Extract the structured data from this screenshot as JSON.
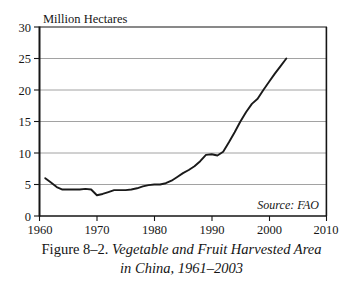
{
  "figure": {
    "caption_figure_number": "Figure 8–2.",
    "caption_title_line1": "Vegetable and Fruit Harvested Area",
    "caption_title_line2": "in China, 1961–2003",
    "source_note": "Source: FAO"
  },
  "chart_data": {
    "type": "line",
    "title": "",
    "subtitle": "",
    "xlabel": "",
    "ylabel": "Million Hectares",
    "xlim": [
      1960,
      2010
    ],
    "ylim": [
      0,
      30
    ],
    "xticks": [
      1960,
      1970,
      1980,
      1990,
      2000,
      2010
    ],
    "yticks": [
      0,
      5,
      10,
      15,
      20,
      25,
      30
    ],
    "xtick_labels": [
      "1960",
      "1970",
      "1980",
      "1990",
      "2000",
      "2010"
    ],
    "ytick_labels": [
      "0",
      "5",
      "10",
      "15",
      "20",
      "25",
      "30"
    ],
    "grid": "horizontal",
    "legend": "none",
    "annotations": [
      "Source: FAO"
    ],
    "series": [
      {
        "name": "Vegetable and Fruit Harvested Area",
        "units": "Million Hectares",
        "color": "#1a1a1a",
        "x": [
          1961,
          1962,
          1963,
          1964,
          1965,
          1966,
          1967,
          1968,
          1969,
          1970,
          1971,
          1972,
          1973,
          1974,
          1975,
          1976,
          1977,
          1978,
          1979,
          1980,
          1981,
          1982,
          1983,
          1984,
          1985,
          1986,
          1987,
          1988,
          1989,
          1990,
          1991,
          1992,
          1993,
          1994,
          1995,
          1996,
          1997,
          1998,
          1999,
          2000,
          2001,
          2002,
          2003
        ],
        "values": [
          6.0,
          5.3,
          4.6,
          4.2,
          4.2,
          4.2,
          4.2,
          4.3,
          4.2,
          3.3,
          3.5,
          3.8,
          4.1,
          4.1,
          4.1,
          4.2,
          4.4,
          4.7,
          4.9,
          5.0,
          5.0,
          5.2,
          5.6,
          6.2,
          6.8,
          7.3,
          7.9,
          8.7,
          9.7,
          9.8,
          9.6,
          10.2,
          11.7,
          13.3,
          15.0,
          16.5,
          17.8,
          18.6,
          20.0,
          21.3,
          22.6,
          23.8,
          25.0
        ]
      }
    ]
  }
}
